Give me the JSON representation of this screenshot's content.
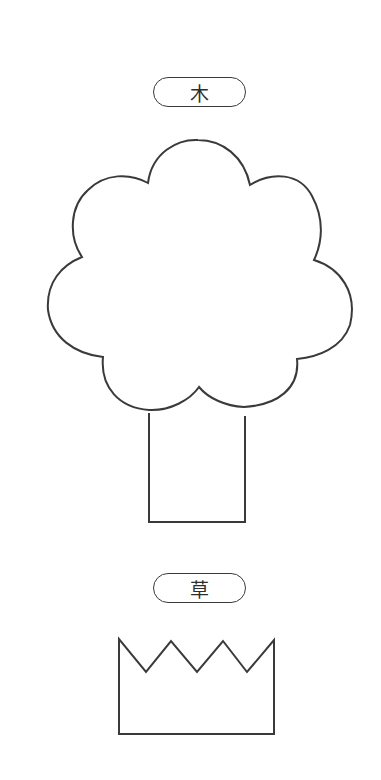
{
  "labels": {
    "tree": "木",
    "grass": "草"
  },
  "colors": {
    "stroke": "#3a3a3a",
    "background": "#ffffff"
  },
  "shapes": [
    {
      "name": "tree",
      "parts": [
        "cloud-crown",
        "rectangular-trunk"
      ]
    },
    {
      "name": "grass",
      "parts": [
        "zigzag-top-box"
      ]
    }
  ]
}
